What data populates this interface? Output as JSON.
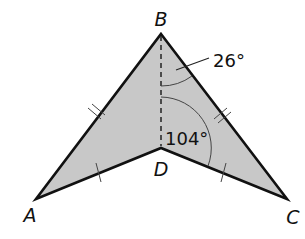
{
  "figure": {
    "type": "kite-shaped concave quadrilateral (dart)",
    "vertices": {
      "A": "A",
      "B": "B",
      "C": "C",
      "D": "D"
    },
    "angles": {
      "angle_DBC": "26°",
      "angle_BDC": "104°"
    },
    "markings": {
      "AB_equals_CB": "double tick",
      "AD_equals_CD": "single tick",
      "BD": "dashed segment"
    },
    "fill_color": "#c8c8c8",
    "stroke_color": "#111111"
  }
}
